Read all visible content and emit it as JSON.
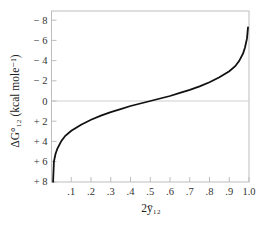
{
  "chart_data": {
    "type": "line",
    "title": "",
    "xlabel": "2ȳ₁₂",
    "ylabel": "ΔG°₁₂ (kcal mole⁻¹)",
    "xlim": [
      0,
      1.0
    ],
    "ylim": [
      8,
      -8
    ],
    "y_axis_inverted": true,
    "grid": false,
    "reference_line": {
      "y": 0,
      "color": "#cfcfcf"
    },
    "x_ticks": [
      0.1,
      0.2,
      0.3,
      0.4,
      0.5,
      0.6,
      0.7,
      0.8,
      0.9,
      1.0
    ],
    "x_tick_labels": [
      ".1",
      ".2",
      ".3",
      ".4",
      ".5",
      ".6",
      ".7",
      ".8",
      ".9",
      "1.0"
    ],
    "y_ticks": [
      -8,
      -6,
      -4,
      -2,
      0,
      2,
      4,
      6,
      8
    ],
    "y_tick_labels": [
      "− 8",
      "− 6",
      "− 4",
      "− 2",
      "0",
      "+ 2",
      "+ 4",
      "+ 6",
      "+ 8"
    ],
    "series": [
      {
        "name": "ΔG°12 vs 2y12",
        "color": "#111111",
        "x": [
          0.008,
          0.012,
          0.02,
          0.03,
          0.05,
          0.07,
          0.1,
          0.15,
          0.2,
          0.25,
          0.3,
          0.35,
          0.4,
          0.45,
          0.5,
          0.55,
          0.6,
          0.65,
          0.7,
          0.75,
          0.8,
          0.85,
          0.9,
          0.93,
          0.95,
          0.97,
          0.98,
          0.99,
          0.995
        ],
        "y": [
          8.0,
          6.0,
          5.25,
          4.7,
          3.95,
          3.45,
          2.95,
          2.35,
          1.85,
          1.45,
          1.1,
          0.8,
          0.5,
          0.25,
          0.0,
          -0.25,
          -0.5,
          -0.8,
          -1.1,
          -1.45,
          -1.85,
          -2.35,
          -2.95,
          -3.45,
          -3.95,
          -4.7,
          -5.3,
          -6.2,
          -7.3
        ]
      }
    ]
  }
}
